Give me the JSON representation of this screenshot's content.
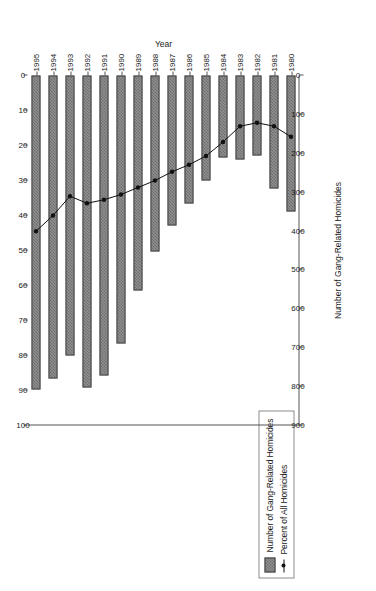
{
  "legend": {
    "entries": [
      {
        "label": "Number of Gang-Related Homicides",
        "marker": "bar-swatch"
      },
      {
        "label": "Percent of All Homicides",
        "marker": "line-marker"
      }
    ]
  },
  "axes": {
    "category_title": "Year",
    "number_title": "Number of Gang-Related Homicides",
    "percent_title": "Percent of all Homicides",
    "number_ticks": [
      0,
      100,
      200,
      300,
      400,
      500,
      600,
      700,
      800,
      900
    ],
    "percent_ticks": [
      0,
      10,
      20,
      30,
      40,
      50,
      60,
      70,
      80,
      90,
      100
    ]
  },
  "chart_data": {
    "type": "bar",
    "title": "",
    "xlabel": "Year",
    "ylabel": "Number of Gang-Related Homicides",
    "y2label": "Percent of all Homicides",
    "ylim": [
      0,
      900
    ],
    "y2lim": [
      0,
      100
    ],
    "grid": false,
    "legend_position": "top-right",
    "orientation": "horizontal-bars-rotated",
    "categories": [
      "1980",
      "1981",
      "1982",
      "1983",
      "1984",
      "1985",
      "1986",
      "1987",
      "1988",
      "1989",
      "1990",
      "1991",
      "1992",
      "1993",
      "1994",
      "1995"
    ],
    "series": [
      {
        "name": "Number of Gang-Related Homicides",
        "type": "bar",
        "axis": "number",
        "values": [
          351,
          291,
          205,
          216,
          212,
          271,
          328,
          387,
          452,
          554,
          690,
          771,
          803,
          720,
          779,
          807
        ]
      },
      {
        "name": "Percent of All Homicides",
        "type": "line",
        "axis": "percent",
        "values": [
          17.5,
          14.5,
          13.5,
          14.5,
          19.0,
          23.0,
          25.5,
          27.5,
          30.0,
          32.0,
          34.0,
          35.5,
          36.5,
          34.5,
          40.0,
          44.5
        ]
      }
    ]
  }
}
